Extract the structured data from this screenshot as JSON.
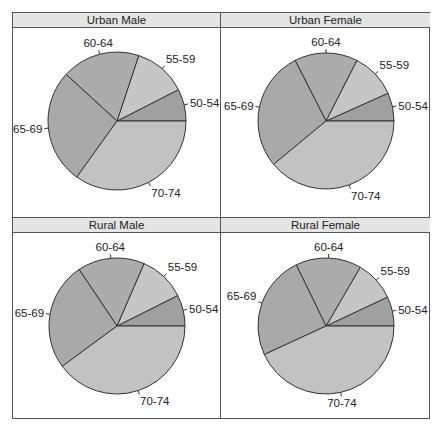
{
  "chart_data": [
    {
      "type": "pie",
      "title": "Urban Male",
      "categories": [
        "50-54",
        "55-59",
        "60-64",
        "65-69",
        "70-74"
      ],
      "values": [
        7.5,
        12.4,
        18.3,
        26.9,
        34.9
      ],
      "start_angle_deg": 0,
      "direction": "counterclockwise"
    },
    {
      "type": "pie",
      "title": "Urban Female",
      "categories": [
        "50-54",
        "55-59",
        "60-64",
        "65-69",
        "70-74"
      ],
      "values": [
        6.7,
        10.8,
        15.0,
        28.5,
        39.0
      ],
      "start_angle_deg": 0,
      "direction": "counterclockwise"
    },
    {
      "type": "pie",
      "title": "Rural Male",
      "categories": [
        "50-54",
        "55-59",
        "60-64",
        "65-69",
        "70-74"
      ],
      "values": [
        7.4,
        11.1,
        15.9,
        25.7,
        39.9
      ],
      "start_angle_deg": 0,
      "direction": "counterclockwise"
    },
    {
      "type": "pie",
      "title": "Rural Female",
      "categories": [
        "50-54",
        "55-59",
        "60-64",
        "65-69",
        "70-74"
      ],
      "values": [
        7.0,
        9.6,
        15.6,
        24.7,
        43.1
      ],
      "start_angle_deg": 0,
      "direction": "counterclockwise"
    }
  ],
  "colors": {
    "50-54": "#a0a0a0",
    "55-59": "#c6c6c6",
    "60-64": "#acacac",
    "65-69": "#a9a9a9",
    "70-74": "#c2c2c2"
  },
  "panels": [
    {
      "title": "Urban Male"
    },
    {
      "title": "Urban Female"
    },
    {
      "title": "Rural Male"
    },
    {
      "title": "Rural Female"
    }
  ]
}
